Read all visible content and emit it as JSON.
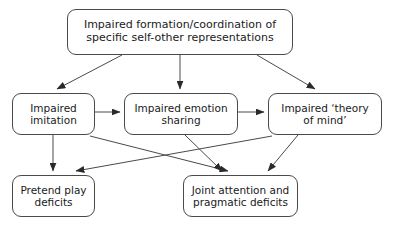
{
  "diagram": {
    "background_color": "#ffffff",
    "stroke_color": "#4a4a4a",
    "text_color": "#1a1a1a",
    "nodes": [
      {
        "id": "root",
        "label": "Impaired formation/coordination of\nspecific self-other representations",
        "line1": "Impaired formation/coordination of",
        "line2": "specific self-other representations",
        "x": 67,
        "y": 9,
        "w": 226,
        "h": 46
      },
      {
        "id": "imitation",
        "label": "Impaired\nimitation",
        "line1": "Impaired",
        "line2": "imitation",
        "x": 12,
        "y": 93,
        "w": 83,
        "h": 42
      },
      {
        "id": "emotion",
        "label": "Impaired emotion\nsharing",
        "line1": "Impaired emotion",
        "line2": "sharing",
        "x": 124,
        "y": 93,
        "w": 114,
        "h": 42
      },
      {
        "id": "theory",
        "label": "Impaired ‘theory\nof mind’",
        "line1": "Impaired ‘theory",
        "line2": "of mind’",
        "x": 268,
        "y": 93,
        "w": 114,
        "h": 42
      },
      {
        "id": "pretend",
        "label": "Pretend play\ndeficits",
        "line1": "Pretend play",
        "line2": "deficits",
        "x": 12,
        "y": 175,
        "w": 83,
        "h": 42
      },
      {
        "id": "joint",
        "label": "Joint attention and\npragmatic deficits",
        "line1": "Joint attention and",
        "line2": "pragmatic deficits",
        "x": 183,
        "y": 175,
        "w": 115,
        "h": 42
      }
    ],
    "edges": [
      {
        "id": "root-to-imitation",
        "from": "root",
        "to": "imitation",
        "arrowhead": true
      },
      {
        "id": "root-to-emotion",
        "from": "root",
        "to": "emotion",
        "arrowhead": true
      },
      {
        "id": "root-to-theory",
        "from": "root",
        "to": "theory",
        "arrowhead": true
      },
      {
        "id": "imitation-to-emotion",
        "from": "imitation",
        "to": "emotion",
        "arrowhead": true
      },
      {
        "id": "emotion-to-theory",
        "from": "emotion",
        "to": "theory",
        "arrowhead": true
      },
      {
        "id": "imitation-to-pretend",
        "from": "imitation",
        "to": "pretend",
        "arrowhead": true
      },
      {
        "id": "imitation-to-joint",
        "from": "imitation",
        "to": "joint",
        "arrowhead": true
      },
      {
        "id": "emotion-to-joint",
        "from": "emotion",
        "to": "joint",
        "arrowhead": true
      },
      {
        "id": "theory-to-joint",
        "from": "theory",
        "to": "joint",
        "arrowhead": true
      },
      {
        "id": "theory-to-pretend",
        "from": "theory",
        "to": "pretend",
        "arrowhead": true
      }
    ]
  }
}
